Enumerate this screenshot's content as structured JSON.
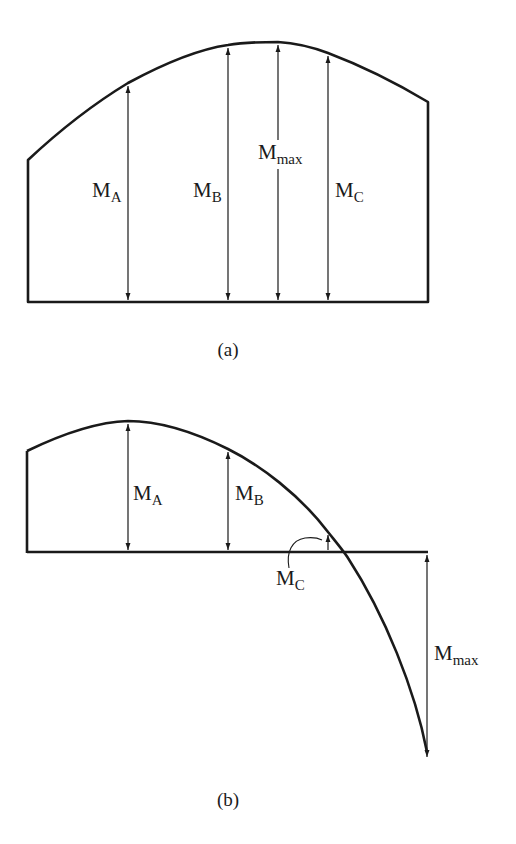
{
  "figure": {
    "panels": [
      {
        "id": "a",
        "caption": "(a)",
        "labels": {
          "MA": {
            "main": "M",
            "sub": "A"
          },
          "MB": {
            "main": "M",
            "sub": "B"
          },
          "Mmax": {
            "main": "M",
            "sub": "max"
          },
          "MC": {
            "main": "M",
            "sub": "C"
          }
        }
      },
      {
        "id": "b",
        "caption": "(b)",
        "labels": {
          "MA": {
            "main": "M",
            "sub": "A"
          },
          "MB": {
            "main": "M",
            "sub": "B"
          },
          "MC": {
            "main": "M",
            "sub": "C"
          },
          "Mmax": {
            "main": "M",
            "sub": "max"
          }
        }
      }
    ]
  },
  "colors": {
    "line": "#1a1a1a",
    "background": "#ffffff"
  }
}
